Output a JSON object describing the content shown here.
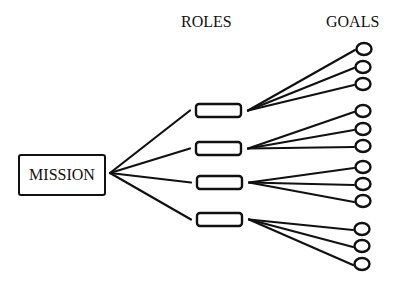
{
  "headers": {
    "roles": "ROLES",
    "goals": "GOALS"
  },
  "mission": {
    "label": "MISSION",
    "box": {
      "x": 18,
      "y": 154,
      "w": 86,
      "h": 40
    },
    "hub": {
      "x": 110,
      "y": 173
    }
  },
  "colors": {
    "stroke": "#111111",
    "background": "#ffffff"
  },
  "roles": [
    {
      "box": {
        "x": 196,
        "y": 104,
        "w": 45,
        "h": 13
      },
      "goals": [
        {
          "x": 364,
          "y": 49
        },
        {
          "x": 363,
          "y": 67
        },
        {
          "x": 363,
          "y": 84
        }
      ]
    },
    {
      "box": {
        "x": 196,
        "y": 142,
        "w": 45,
        "h": 13
      },
      "goals": [
        {
          "x": 363,
          "y": 111
        },
        {
          "x": 363,
          "y": 129
        },
        {
          "x": 363,
          "y": 146
        }
      ]
    },
    {
      "box": {
        "x": 197,
        "y": 176,
        "w": 45,
        "h": 13
      },
      "goals": [
        {
          "x": 363,
          "y": 167
        },
        {
          "x": 363,
          "y": 184
        },
        {
          "x": 363,
          "y": 201
        }
      ]
    },
    {
      "box": {
        "x": 197,
        "y": 213,
        "w": 45,
        "h": 13
      },
      "goals": [
        {
          "x": 362,
          "y": 229
        },
        {
          "x": 362,
          "y": 246
        },
        {
          "x": 362,
          "y": 264
        }
      ]
    }
  ]
}
